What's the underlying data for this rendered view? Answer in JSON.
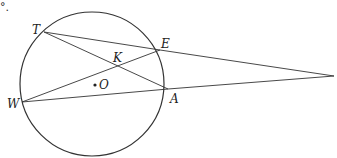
{
  "fragment": {
    "text": "°."
  },
  "diagram": {
    "circle": {
      "cx": 92,
      "cy": 84,
      "r": 72,
      "center_label": "O"
    },
    "points": {
      "T": {
        "x": 44,
        "y": 32,
        "label": "T"
      },
      "E": {
        "x": 160,
        "y": 50,
        "label": "E"
      },
      "W": {
        "x": 22,
        "y": 102,
        "label": "W"
      },
      "A": {
        "x": 168,
        "y": 89,
        "label": "A"
      },
      "K": {
        "x": 118,
        "y": 65,
        "label": "K"
      },
      "P": {
        "x": 334,
        "y": 76,
        "label": ""
      }
    },
    "segments": [
      [
        "T",
        "E"
      ],
      [
        "T",
        "A"
      ],
      [
        "W",
        "E"
      ],
      [
        "W",
        "A"
      ],
      [
        "E",
        "P"
      ],
      [
        "A",
        "P"
      ]
    ],
    "colors": {
      "stroke": "#333333",
      "background": "#ffffff"
    }
  }
}
